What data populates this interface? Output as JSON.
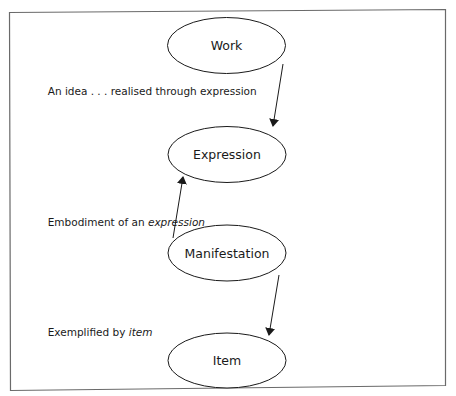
{
  "diagram": {
    "type": "flow",
    "frame": {
      "stroke": "#6a6a6a"
    },
    "nodes": [
      {
        "id": "work",
        "label": "Work",
        "shape": "ellipse"
      },
      {
        "id": "expression",
        "label": "Expression",
        "shape": "ellipse"
      },
      {
        "id": "manifestation",
        "label": "Manifestation",
        "shape": "ellipse"
      },
      {
        "id": "item",
        "label": "Item",
        "shape": "ellipse"
      }
    ],
    "edges": [
      {
        "from": "work",
        "to": "expression",
        "label_plain": "An idea . . . realised through expression",
        "label_italic": ""
      },
      {
        "from": "manifestation",
        "to": "expression",
        "label_plain": "Embodiment of an ",
        "label_italic": "expression"
      },
      {
        "from": "manifestation",
        "to": "item",
        "label_plain": "Exemplified by ",
        "label_italic": "item"
      }
    ]
  }
}
